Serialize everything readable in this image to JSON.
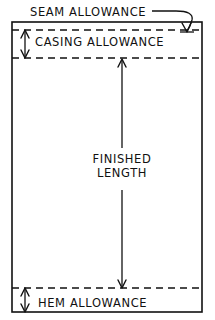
{
  "diagram": {
    "background_color": "#ffffff",
    "line_color": "#111111",
    "labels": {
      "seam_allowance": "SEAM ALLOWANCE",
      "casing_allowance": "CASING ALLOWANCE",
      "finished_length_line1": "FINISHED",
      "finished_length_line2": "LENGTH",
      "hem_allowance": "HEM ALLOWANCE"
    },
    "panel": {
      "left": 12,
      "right": 202,
      "top": 22,
      "bottom": 312
    },
    "guides": {
      "seam_dashed_y": 30,
      "casing_dashed_y": 58,
      "hem_dashed_y": 288
    },
    "dimensions": {
      "casing_arrow_x": 25,
      "casing_arrow_top": 30,
      "casing_arrow_bottom": 58,
      "hem_arrow_x": 25,
      "hem_arrow_top": 288,
      "hem_arrow_bottom": 312,
      "finished_arrow_x": 122,
      "finished_arrow_top": 60,
      "finished_arrow_bottom": 287
    }
  }
}
